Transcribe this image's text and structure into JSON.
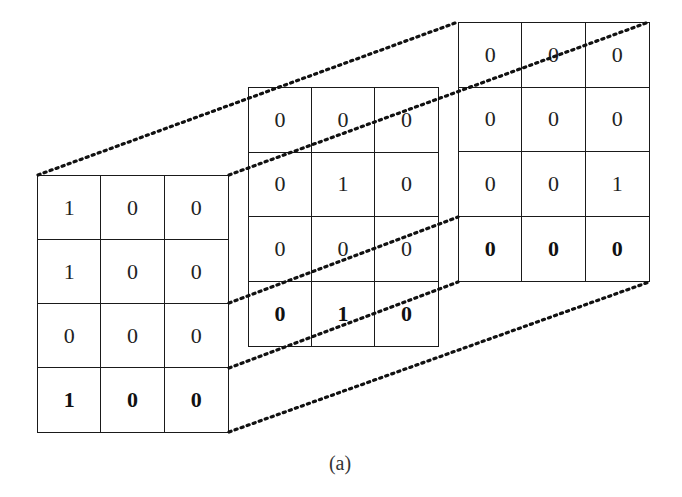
{
  "figure": {
    "caption": "(a)",
    "line_color": "#1a1a1a",
    "background": "#ffffff"
  },
  "grids": [
    {
      "name": "left",
      "rows": [
        [
          "1",
          "0",
          "0"
        ],
        [
          "1",
          "0",
          "0"
        ],
        [
          "0",
          "0",
          "0"
        ],
        [
          "1",
          "0",
          "0"
        ]
      ],
      "bold_last_row": true
    },
    {
      "name": "middle",
      "rows": [
        [
          "0",
          "0",
          "0"
        ],
        [
          "0",
          "1",
          "0"
        ],
        [
          "0",
          "0",
          "0"
        ],
        [
          "0",
          "1",
          "0"
        ]
      ],
      "bold_last_row": true
    },
    {
      "name": "right",
      "rows": [
        [
          "0",
          "0",
          "0"
        ],
        [
          "0",
          "0",
          "0"
        ],
        [
          "0",
          "0",
          "1"
        ],
        [
          "0",
          "0",
          "0"
        ]
      ],
      "bold_last_row": true
    }
  ]
}
